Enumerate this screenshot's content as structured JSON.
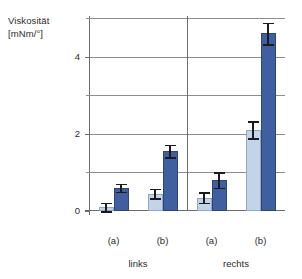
{
  "chart_data": {
    "type": "bar",
    "title": "",
    "ylabel": "Viskosität [mNm/°]",
    "ylabel_line1": "Viskosität",
    "ylabel_line2": "[mNm/°]",
    "xlabel": "",
    "categories": [
      "(a)",
      "(b)",
      "(a)",
      "(b)"
    ],
    "group_labels": [
      "links",
      "rechts"
    ],
    "ylim": [
      0,
      5.0
    ],
    "yticks": [
      0,
      2,
      4
    ],
    "ytick_labels": [
      "0",
      "2",
      "4"
    ],
    "yticks_minor": [
      1,
      3,
      5
    ],
    "grid": true,
    "gridlines": [
      1,
      2,
      3,
      4,
      5
    ],
    "legend": "none",
    "series": [
      {
        "name": "light",
        "color": "#c3d3ea",
        "values": [
          0.1,
          0.45,
          0.35,
          2.1
        ],
        "errors": [
          0.12,
          0.12,
          0.13,
          0.22
        ]
      },
      {
        "name": "dark",
        "color": "#3f5fa0",
        "values": [
          0.6,
          1.55,
          0.8,
          4.6
        ],
        "errors": [
          0.1,
          0.16,
          0.2,
          0.28
        ]
      }
    ]
  },
  "axis": {
    "ytick_0": "0",
    "ytick_2": "2",
    "ytick_4": "4"
  },
  "xaxis": {
    "tick_0": "(a)",
    "tick_1": "(b)",
    "tick_2": "(a)",
    "tick_3": "(b)",
    "group_0": "links",
    "group_1": "rechts"
  }
}
